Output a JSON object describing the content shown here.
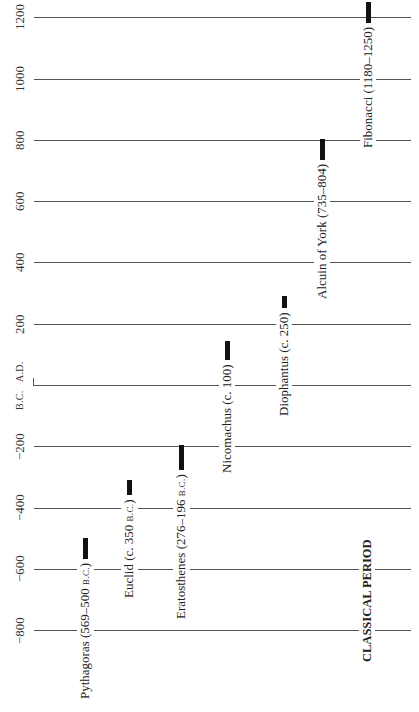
{
  "chart_data": {
    "type": "timeline",
    "title": "",
    "orientation": "vertical (year increases upward), labels rotated -90deg",
    "axis": {
      "label": "Year",
      "range": [
        -850,
        1260
      ],
      "ticks": [
        {
          "value": 1200,
          "label": "1200"
        },
        {
          "value": 1000,
          "label": "1000"
        },
        {
          "value": 800,
          "label": "800"
        },
        {
          "value": 600,
          "label": "600"
        },
        {
          "value": 400,
          "label": "400"
        },
        {
          "value": 200,
          "label": "200"
        },
        {
          "value": -200,
          "label": "−200"
        },
        {
          "value": -400,
          "label": "−400"
        },
        {
          "value": -600,
          "label": "−600"
        },
        {
          "value": -800,
          "label": "−800"
        }
      ],
      "era_divider": {
        "value": 0,
        "above": "A.D.",
        "below": "B.C."
      },
      "grid": true
    },
    "series": [
      {
        "name": "Pythagoras",
        "start": -569,
        "end": -500,
        "label_main": "Pythagoras (569–500 ",
        "label_era": "B.C.",
        "label_close": ")"
      },
      {
        "name": "Euclid",
        "start": -360,
        "end": -310,
        "label_main": "Euclid (c. 350 ",
        "label_era": "B.C.",
        "label_close": ")"
      },
      {
        "name": "Eratosthenes",
        "start": -276,
        "end": -196,
        "label_main": "Eratosthenes (276–196 ",
        "label_era": "B.C.",
        "label_close": ")"
      },
      {
        "name": "Nicomachus",
        "start": 80,
        "end": 145,
        "label_main": "Nicomachus (c. 100)",
        "label_era": "",
        "label_close": ""
      },
      {
        "name": "Diophantus",
        "start": 250,
        "end": 290,
        "label_main": "Diophantus (c. 250)",
        "label_era": "",
        "label_close": ""
      },
      {
        "name": "Alcuin of York",
        "start": 735,
        "end": 804,
        "label_main": "Alcuin of York (735–804)",
        "label_era": "",
        "label_close": ""
      },
      {
        "name": "Fibonacci",
        "start": 1180,
        "end": 1250,
        "label_main": "Fibonacci (1180–1250)",
        "label_era": "",
        "label_close": ""
      }
    ],
    "annotations": [
      {
        "text": "CLASSICAL PERIOD",
        "style": "bold"
      }
    ]
  },
  "labels": {
    "era_above": "A.D.",
    "era_below": "B.C.",
    "period": "CLASSICAL PERIOD"
  }
}
